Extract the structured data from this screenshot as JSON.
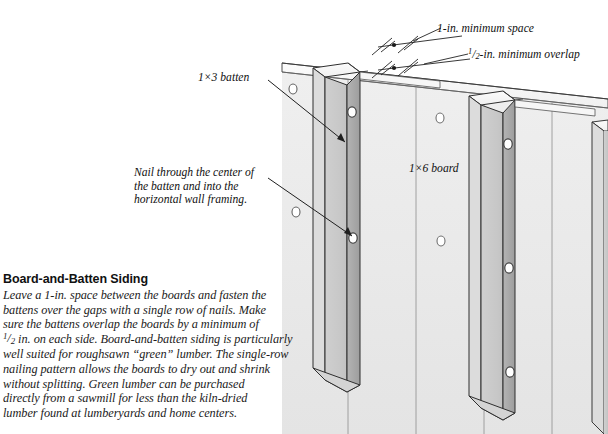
{
  "figure": {
    "title": "Board-and-Batten Siding",
    "body": "Leave a 1-in. space between the boards and fasten the battens over the gaps with a single row of nails. Make sure the battens overlap the boards by a minimum of ½ in. on each side. Board-and-batten siding is particularly well suited for roughsawn “green” lumber. The single-row nailing pattern allows the boards to dry out and shrink without splitting. Green lumber can be purchased directly from a sawmill for less than the kiln-dried lumber found at lumberyards and home centers.",
    "body_lines": [
      "Leave a 1-in. space between the boards and fasten the",
      "battens over the gaps with a single row of nails. Make",
      "sure the battens overlap the boards by a minimum of",
      "½ in. on each side. Board-and-batten siding is particularly",
      "well suited for roughsawn “green” lumber. The single-row",
      "nailing pattern allows the boards to dry out and shrink",
      "without splitting. Green lumber can be purchased",
      "directly from a sawmill for less than the kiln-dried",
      "lumber found at lumberyards and home centers."
    ]
  },
  "labels": {
    "batten": "1×3 batten",
    "board": "1×6 board",
    "min_space": "1-in. minimum space",
    "min_overlap": "½-in. minimum overlap",
    "nail_note_line1": "Nail through the center of",
    "nail_note_line2": "the batten and into the",
    "nail_note_line3": "horizontal wall framing."
  },
  "colors": {
    "background": "#ffffff",
    "board_face": "#ececec",
    "board_face_shadow": "#e3e3e3",
    "batten_face": "#c9c9c9",
    "batten_edge": "#a5a5a5",
    "batten_top": "#f4f4f4",
    "outline": "#2b2b2b",
    "text": "#111111",
    "nail_hole_fill": "#ffffff"
  },
  "drawing": {
    "type": "isometric-cutaway",
    "subject": "board-and-batten siding wall section",
    "board_count": 4,
    "batten_count": 3,
    "nail_hole_count": 10,
    "dimension_callouts": 2
  }
}
